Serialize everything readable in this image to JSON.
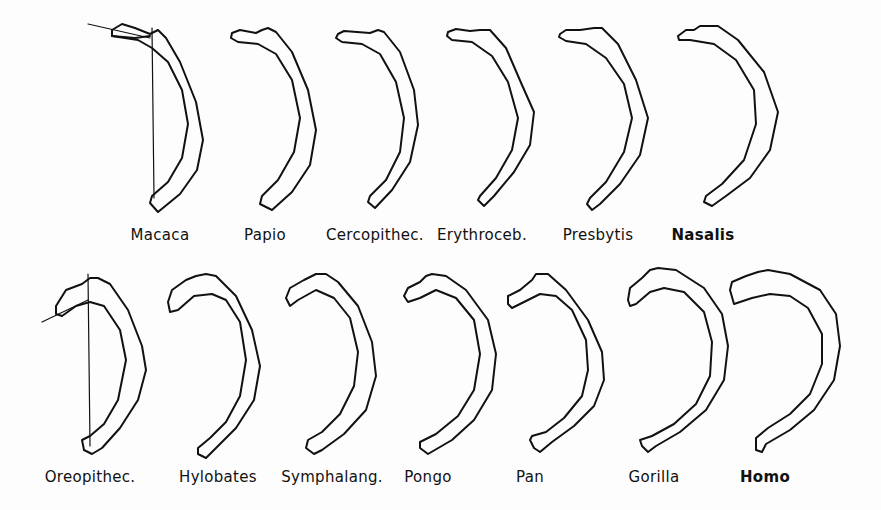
{
  "figure": {
    "rows": [
      {
        "items": [
          {
            "label": "Macaca",
            "cx": 160,
            "label_y": 226,
            "bold": false,
            "reference_lines": true
          },
          {
            "label": "Papio",
            "cx": 265,
            "label_y": 226,
            "bold": false
          },
          {
            "label": "Cercopithec.",
            "cx": 375,
            "label_y": 226,
            "bold": false
          },
          {
            "label": "Erythroceb.",
            "cx": 482,
            "label_y": 226,
            "bold": false
          },
          {
            "label": "Presbytis",
            "cx": 598,
            "label_y": 226,
            "bold": false
          },
          {
            "label": "Nasalis",
            "cx": 703,
            "label_y": 226,
            "bold": true
          }
        ]
      },
      {
        "items": [
          {
            "label": "Oreopithec.",
            "cx": 90,
            "label_y": 468,
            "bold": false,
            "reference_lines": true
          },
          {
            "label": "Hylobates",
            "cx": 218,
            "label_y": 468,
            "bold": false
          },
          {
            "label": "Symphalang.",
            "cx": 332,
            "label_y": 468,
            "bold": false
          },
          {
            "label": "Pongo",
            "cx": 428,
            "label_y": 468,
            "bold": false
          },
          {
            "label": "Pan",
            "cx": 530,
            "label_y": 468,
            "bold": false
          },
          {
            "label": "Gorilla",
            "cx": 654,
            "label_y": 468,
            "bold": false
          },
          {
            "label": "Homo",
            "cx": 765,
            "label_y": 468,
            "bold": true
          }
        ]
      }
    ]
  }
}
